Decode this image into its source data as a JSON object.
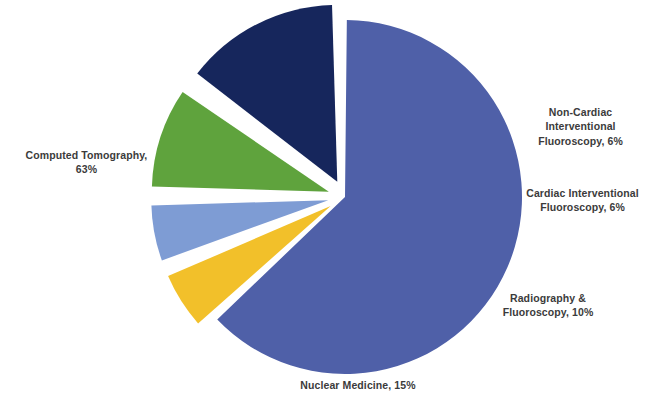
{
  "chart_data": {
    "type": "pie",
    "title": "",
    "categories": [
      "Computed Tomography",
      "Non-Cardiac Interventional Fluoroscopy",
      "Cardiac Interventional Fluoroscopy",
      "Radiography & Fluoroscopy",
      "Nuclear Medicine"
    ],
    "values": [
      63,
      6,
      6,
      10,
      15
    ],
    "unit": "%",
    "legend_position": "none",
    "grid": false,
    "exploded_slices": [
      "Non-Cardiac Interventional Fluoroscopy",
      "Cardiac Interventional Fluoroscopy",
      "Radiography & Fluoroscopy",
      "Nuclear Medicine"
    ],
    "slices": [
      {
        "name": "Computed Tomography",
        "value": 63,
        "label": "Computed Tomography,\n63%",
        "color": "#4F60A8",
        "exploded": false,
        "start_angle": 0,
        "end_angle": 226.8
      },
      {
        "name": "Non-Cardiac Interventional Fluoroscopy",
        "value": 6,
        "label": "Non-Cardiac\nInterventional\nFluoroscopy, 6%",
        "color": "#F2C02A",
        "exploded": true,
        "start_angle": 226.8,
        "end_angle": 248.4
      },
      {
        "name": "Cardiac Interventional Fluoroscopy",
        "value": 6,
        "label": "Cardiac Interventional\nFluoroscopy, 6%",
        "color": "#7E9CD4",
        "exploded": true,
        "start_angle": 248.4,
        "end_angle": 270.0
      },
      {
        "name": "Radiography & Fluoroscopy",
        "value": 10,
        "label": "Radiography &\nFluoroscopy, 10%",
        "color": "#5FA33D",
        "exploded": true,
        "start_angle": 270.0,
        "end_angle": 306.0
      },
      {
        "name": "Nuclear Medicine",
        "value": 15,
        "label": "Nuclear Medicine, 15%",
        "color": "#16265C",
        "exploded": true,
        "start_angle": 306.0,
        "end_angle": 360.0
      }
    ],
    "colors": {
      "computed_tomography": "#4F60A8",
      "non_cardiac_interventional_fluoroscopy": "#F2C02A",
      "cardiac_interventional_fluoroscopy": "#7E9CD4",
      "radiography_fluoroscopy": "#5FA33D",
      "nuclear_medicine": "#16265C",
      "background": "#FFFFFF",
      "label_text": "#3B3B3B"
    }
  },
  "labels": {
    "computed_tomography": "Computed Tomography,\n63%",
    "non_cardiac": "Non-Cardiac\nInterventional\nFluoroscopy, 6%",
    "cardiac": "Cardiac Interventional\nFluoroscopy, 6%",
    "radiography": "Radiography &\nFluoroscopy, 10%",
    "nuclear_medicine": "Nuclear Medicine, 15%"
  }
}
